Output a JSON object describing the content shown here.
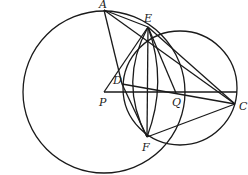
{
  "diagram": {
    "type": "geometry",
    "stroke_color": "#1a1a1a",
    "background": "#ffffff",
    "points": {
      "A": {
        "label": "A",
        "x": 104,
        "y": 10
      },
      "E": {
        "label": "E",
        "x": 148,
        "y": 27
      },
      "D": {
        "label": "D",
        "x": 122,
        "y": 84
      },
      "P": {
        "label": "P",
        "x": 104,
        "y": 92
      },
      "Q": {
        "label": "Q",
        "x": 176,
        "y": 93
      },
      "C": {
        "label": "C",
        "x": 235,
        "y": 104
      },
      "F": {
        "label": "F",
        "x": 147,
        "y": 137
      }
    },
    "circles": [
      {
        "name": "circle-P",
        "cx": 104,
        "cy": 92,
        "r": 81
      },
      {
        "name": "circle-Q",
        "cx": 180,
        "cy": 88,
        "r": 57
      }
    ],
    "segments": [
      [
        "A",
        "D"
      ],
      [
        "A",
        "E"
      ],
      [
        "A",
        "C"
      ],
      [
        "E",
        "P"
      ],
      [
        "E",
        "F"
      ],
      [
        "E",
        "Q"
      ],
      [
        "E",
        "C"
      ],
      [
        "D",
        "C"
      ],
      [
        "D",
        "F"
      ],
      [
        "P",
        "C"
      ],
      [
        "F",
        "C"
      ]
    ]
  }
}
